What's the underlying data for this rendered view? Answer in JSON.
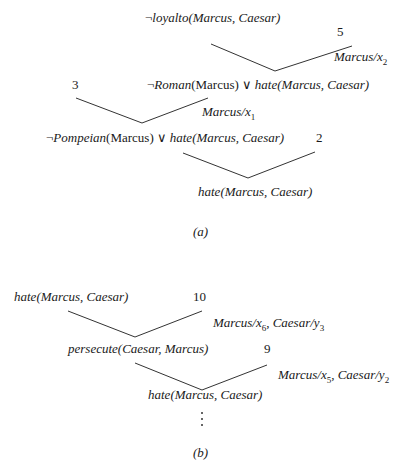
{
  "diagram_a": {
    "label": "(a)",
    "clauses": {
      "loyalto": {
        "neg": "¬",
        "pred": "loyalto",
        "args": "(Marcus, Caesar)"
      },
      "clause5": "5",
      "subst_x2": {
        "name": "Marcus",
        "sep": "/",
        "var": "x",
        "sub": "2"
      },
      "roman": {
        "neg": "¬",
        "pred1": "Roman",
        "args1": "(Marcus)",
        "or": " ∨ ",
        "pred2": "hate",
        "args2": "(Marcus, Caesar)"
      },
      "clause3": "3",
      "subst_x1": {
        "name": "Marcus",
        "sep": "/",
        "var": "x",
        "sub": "1"
      },
      "pompeian": {
        "neg": "¬",
        "pred1": "Pompeian",
        "args1": "(Marcus)",
        "or": " ∨ ",
        "pred2": "hate",
        "args2": "(Marcus, Caesar)"
      },
      "clause2": "2",
      "result": {
        "pred": "hate",
        "args": "(Marcus, Caesar)"
      }
    }
  },
  "diagram_b": {
    "label": "(b)",
    "clauses": {
      "goal": {
        "pred": "hate",
        "args": "(Marcus, Caesar)"
      },
      "clause10": "10",
      "subst_1": {
        "a": "Marcus",
        "av": "x",
        "asub": "6",
        "sep": ", ",
        "b": "Caesar",
        "bv": "y",
        "bsub": "3"
      },
      "persecute": {
        "pred": "persecute",
        "args": "(Caesar, Marcus)"
      },
      "clause9": "9",
      "subst_2": {
        "a": "Marcus",
        "av": "x",
        "asub": "5",
        "sep": ", ",
        "b": "Caesar",
        "bv": "y",
        "bsub": "2"
      },
      "result": {
        "pred": "hate",
        "args": "(Marcus, Caesar)"
      },
      "ellipsis": "⋮"
    }
  }
}
